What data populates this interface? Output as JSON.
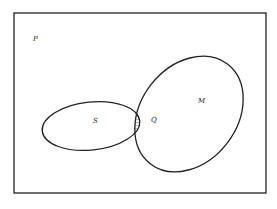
{
  "diagram": {
    "type": "euler",
    "universe": {
      "label": "P"
    },
    "sets": [
      {
        "name": "set-s",
        "label": "S"
      },
      {
        "name": "set-m",
        "label": "M"
      }
    ],
    "intersection": {
      "label": "Q",
      "hatched": true
    },
    "colors": {
      "stroke": "#222222",
      "background": "#ffffff",
      "hatch": "#444444"
    }
  }
}
